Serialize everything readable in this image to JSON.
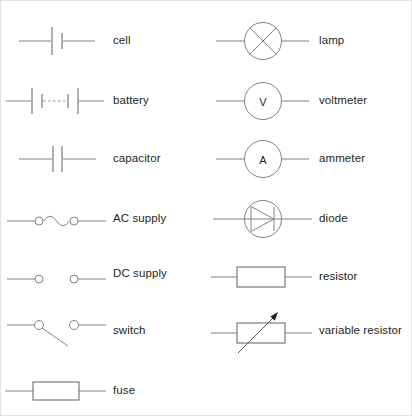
{
  "diagram": {
    "stroke_color": "#808285",
    "text_color": "#231f20",
    "background": "#ffffff",
    "columns": [
      {
        "name": "left-column",
        "rows": [
          {
            "icon": "cell-symbol",
            "label": "cell"
          },
          {
            "icon": "battery-symbol",
            "label": "battery"
          },
          {
            "icon": "capacitor-symbol",
            "label": "capacitor"
          },
          {
            "icon": "ac-supply-symbol",
            "label": "AC supply"
          },
          {
            "icon": "dc-supply-symbol",
            "label": "DC supply",
            "plus": "+",
            "minus": "–"
          },
          {
            "icon": "switch-symbol",
            "label": "switch"
          },
          {
            "icon": "fuse-symbol",
            "label": "fuse"
          }
        ]
      },
      {
        "name": "right-column",
        "rows": [
          {
            "icon": "lamp-symbol",
            "label": "lamp"
          },
          {
            "icon": "voltmeter-symbol",
            "label": "voltmeter",
            "glyph": "V"
          },
          {
            "icon": "ammeter-symbol",
            "label": "ammeter",
            "glyph": "A"
          },
          {
            "icon": "diode-symbol",
            "label": "diode"
          },
          {
            "icon": "resistor-symbol",
            "label": "resistor"
          },
          {
            "icon": "variable-resistor-symbol",
            "label": "variable resistor"
          }
        ]
      }
    ]
  }
}
